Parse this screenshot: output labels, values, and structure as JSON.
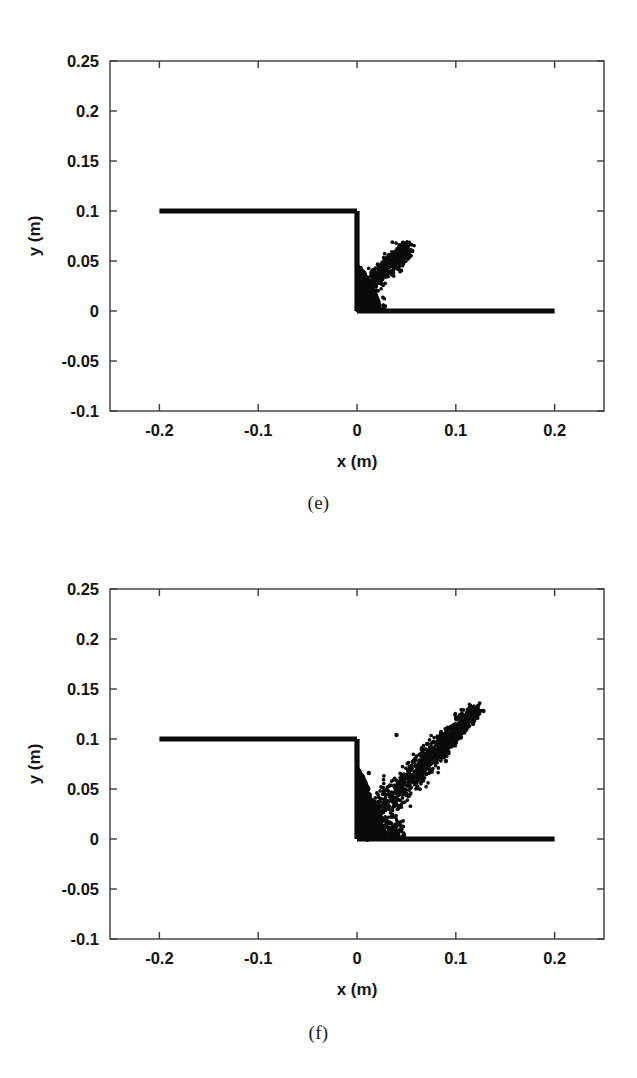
{
  "figure": {
    "panels": [
      {
        "id": "e",
        "caption": "(e)",
        "xlabel": "x (m)",
        "ylabel": "y (m)"
      },
      {
        "id": "f",
        "caption": "(f)",
        "xlabel": "x (m)",
        "ylabel": "y (m)"
      }
    ]
  },
  "axes": {
    "x_ticks": [
      "-0.2",
      "-0.1",
      "0",
      "0.1",
      "0.2"
    ],
    "x_tick_values": [
      -0.2,
      -0.1,
      0,
      0.1,
      0.2
    ],
    "y_ticks": [
      "0.25",
      "0.2",
      "0.15",
      "0.1",
      "0.05",
      "0",
      "-0.05",
      "-0.1"
    ],
    "y_tick_values": [
      0.25,
      0.2,
      0.15,
      0.1,
      0.05,
      0,
      -0.05,
      -0.1
    ],
    "xlim": [
      -0.25,
      0.25
    ],
    "ylim": [
      -0.1,
      0.25
    ]
  },
  "colors": {
    "particle": "#0b0b0b",
    "boundary": "#0b0b0b",
    "frame": "#3a3a3a",
    "text": "#141414",
    "background": "#ffffff"
  },
  "chart_data": [
    {
      "type": "scatter",
      "title": "(e)",
      "xlabel": "x (m)",
      "ylabel": "y (m)",
      "xlim": [
        -0.25,
        0.25
      ],
      "ylim": [
        -0.1,
        0.25
      ],
      "xticks": [
        -0.2,
        -0.1,
        0,
        0.1,
        0.2
      ],
      "yticks": [
        -0.1,
        -0.05,
        0,
        0.05,
        0.1,
        0.15,
        0.2,
        0.25
      ],
      "grid": false,
      "legend": "none",
      "description": "Dam-break SPH particle snapshot: initial water column top surface at y=0.1 from x=-0.2 to x=0, vertical dam face at x=0 from y=0.1 down to y=0, flat bed at y=0 from x=0 to x=0.2; collapsing water forms a dense splash cloud near x=0 to 0.05 rising to about y=0.065.",
      "boundaries": [
        {
          "name": "water-surface",
          "points": [
            [
              -0.2,
              0.1
            ],
            [
              0.0,
              0.1
            ]
          ]
        },
        {
          "name": "dam-face",
          "points": [
            [
              0.0,
              0.1
            ],
            [
              0.0,
              0.0
            ]
          ]
        },
        {
          "name": "bed",
          "points": [
            [
              0.0,
              0.0
            ],
            [
              0.2,
              0.0
            ]
          ]
        }
      ],
      "cloud": {
        "x_range": [
          -0.004,
          0.058
        ],
        "y_range": [
          0.0,
          0.068
        ],
        "peak_x": 0.052,
        "peak_y": 0.066,
        "dense_core_x": [
          0.0,
          0.022
        ],
        "dense_core_y": [
          0.0,
          0.045
        ],
        "n_points": 1500
      }
    },
    {
      "type": "scatter",
      "title": "(f)",
      "xlabel": "x (m)",
      "ylabel": "y (m)",
      "xlim": [
        -0.25,
        0.25
      ],
      "ylim": [
        -0.1,
        0.25
      ],
      "xticks": [
        -0.2,
        -0.1,
        0,
        0.1,
        0.2
      ],
      "yticks": [
        -0.1,
        -0.05,
        0,
        0.05,
        0.1,
        0.15,
        0.2,
        0.25
      ],
      "grid": false,
      "legend": "none",
      "description": "Later dam-break SPH particle snapshot: same boundaries, with a developed inclined splash jet running from the dam corner diagonally up-right to about x=0.12, y=0.13, plus a dense churned region between x=0 and x=0.05 near the bed.",
      "boundaries": [
        {
          "name": "water-surface",
          "points": [
            [
              -0.2,
              0.1
            ],
            [
              0.0,
              0.1
            ]
          ]
        },
        {
          "name": "dam-face",
          "points": [
            [
              0.0,
              0.1
            ],
            [
              0.0,
              0.0
            ]
          ]
        },
        {
          "name": "bed",
          "points": [
            [
              0.0,
              0.0
            ],
            [
              0.2,
              0.0
            ]
          ]
        }
      ],
      "cloud": {
        "x_range": [
          -0.004,
          0.128
        ],
        "y_range": [
          0.0,
          0.132
        ],
        "peak_x": 0.122,
        "peak_y": 0.13,
        "dense_core_x": [
          0.0,
          0.045
        ],
        "dense_core_y": [
          0.0,
          0.075
        ],
        "jet_angle_deg": 46,
        "n_points": 2200
      }
    }
  ]
}
